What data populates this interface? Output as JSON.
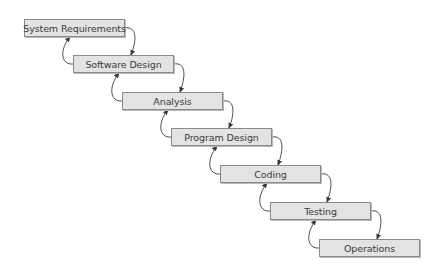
{
  "diagram": {
    "type": "waterfall-process",
    "colors": {
      "box_fill": "#e3e3e3",
      "box_border": "#8a8a8a",
      "text": "#3a3a3a",
      "arrow": "#3a3a3a",
      "background": "#ffffff"
    },
    "stages": [
      {
        "label": "System Requirements",
        "x": 24,
        "y": 19
      },
      {
        "label": "Software Design",
        "x": 73,
        "y": 55
      },
      {
        "label": "Analysis",
        "x": 122,
        "y": 92
      },
      {
        "label": "Program Design",
        "x": 171,
        "y": 128
      },
      {
        "label": "Coding",
        "x": 220,
        "y": 165
      },
      {
        "label": "Testing",
        "x": 270,
        "y": 202
      },
      {
        "label": "Operations",
        "x": 319,
        "y": 239
      }
    ],
    "connections": [
      {
        "from": "System Requirements",
        "to": "Software Design",
        "kind": "forward"
      },
      {
        "from": "Software Design",
        "to": "System Requirements",
        "kind": "feedback"
      },
      {
        "from": "Software Design",
        "to": "Analysis",
        "kind": "forward"
      },
      {
        "from": "Analysis",
        "to": "Software Design",
        "kind": "feedback"
      },
      {
        "from": "Analysis",
        "to": "Program Design",
        "kind": "forward"
      },
      {
        "from": "Program Design",
        "to": "Analysis",
        "kind": "feedback"
      },
      {
        "from": "Program Design",
        "to": "Coding",
        "kind": "forward"
      },
      {
        "from": "Coding",
        "to": "Program Design",
        "kind": "feedback"
      },
      {
        "from": "Coding",
        "to": "Testing",
        "kind": "forward"
      },
      {
        "from": "Testing",
        "to": "Coding",
        "kind": "feedback"
      },
      {
        "from": "Testing",
        "to": "Operations",
        "kind": "forward"
      },
      {
        "from": "Operations",
        "to": "Testing",
        "kind": "feedback"
      }
    ]
  }
}
